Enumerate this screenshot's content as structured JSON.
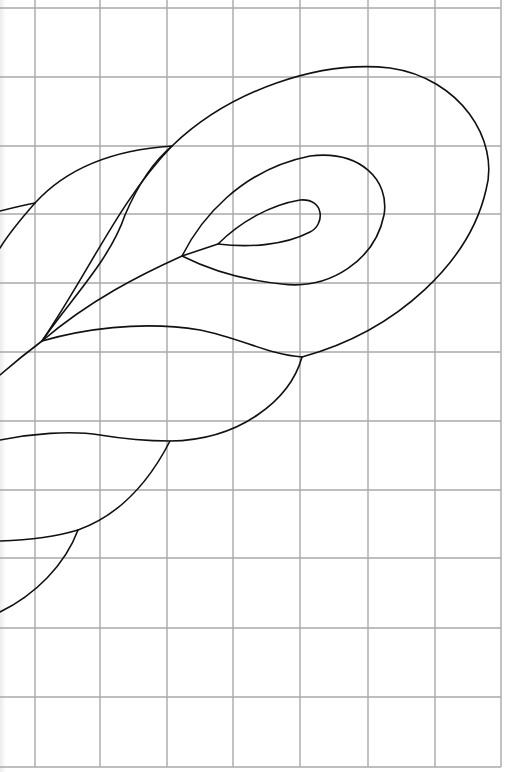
{
  "pattern": {
    "title": "Feather plume quilting pattern on grid",
    "background_color": "#ffffff",
    "grid_color": "#a8a8a8",
    "line_color": "#111111"
  },
  "grid": {
    "vertical_x": [
      35,
      100,
      167,
      233,
      300,
      368,
      435,
      501
    ],
    "horizontal_y": [
      8,
      77,
      146,
      214,
      283,
      352,
      421,
      490,
      558,
      628,
      697,
      767
    ],
    "left": 0,
    "right": 501,
    "top": 8,
    "bottom": 767
  },
  "curves": [
    {
      "name": "outer-plume-loop",
      "d": "M 42 341 C 90 270, 120 200, 172 146 C 230 90, 320 60, 390 68 C 460 78, 500 140, 486 190 C 470 260, 400 330, 302 357"
    },
    {
      "name": "middle-plume-loop",
      "d": "M 182 256 C 200 220, 240 170, 310 156 C 360 150, 390 180, 384 215 C 375 260, 330 290, 282 284 C 240 280, 210 270, 182 256"
    },
    {
      "name": "inner-teardrop",
      "d": "M 218 244 C 240 222, 270 205, 300 200 C 325 198, 325 225, 310 232 C 285 245, 250 248, 218 244"
    },
    {
      "name": "central-spine",
      "d": "M 0 375 C 15 362, 30 350, 42 341 C 90 300, 140 275, 182 256 L 218 244"
    },
    {
      "name": "second-feather-vein",
      "d": "M 42 341 C 70 300, 110 260, 125 215 C 140 180, 155 160, 172 146"
    },
    {
      "name": "upper-left-feather",
      "d": "M 172 146 C 110 150, 65 170, 35 203 C 20 220, 8 235, 0 248"
    },
    {
      "name": "top-left-stub",
      "d": "M 0 211 C 12 208, 24 205, 35 203"
    },
    {
      "name": "mid-wave",
      "d": "M 42 341 C 80 330, 140 320, 200 330 C 240 338, 270 355, 302 357"
    },
    {
      "name": "lower-feather-arc",
      "d": "M 302 357 C 290 400, 240 440, 170 441"
    },
    {
      "name": "lower-wave",
      "d": "M 0 440 C 30 434, 70 430, 100 435 C 130 440, 150 441, 170 441 C 150 480, 120 515, 78 530"
    },
    {
      "name": "bottom-left-arc",
      "d": "M 0 541 C 30 540, 55 537, 78 530"
    },
    {
      "name": "bottom-left-tail",
      "d": "M 78 530 C 65 565, 35 595, 0 612"
    }
  ]
}
